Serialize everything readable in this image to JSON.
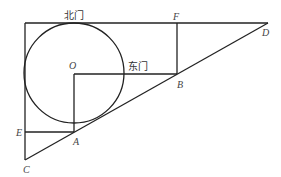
{
  "diagram": {
    "type": "geometry",
    "points": {
      "O": {
        "label": "O",
        "x": 74,
        "y": 73
      },
      "A": {
        "label": "A",
        "x": 74,
        "y": 132
      },
      "B": {
        "label": "B",
        "x": 177,
        "y": 74
      },
      "C": {
        "label": "C",
        "x": 25,
        "y": 160
      },
      "D": {
        "label": "D",
        "x": 268,
        "y": 23
      },
      "E": {
        "label": "E",
        "x": 25,
        "y": 132
      },
      "F": {
        "label": "F",
        "x": 177,
        "y": 23
      }
    },
    "circle": {
      "center": "O",
      "radius": 50
    },
    "gate_labels": {
      "north": "北门",
      "east": "东门"
    },
    "stroke_color": "#222222"
  }
}
